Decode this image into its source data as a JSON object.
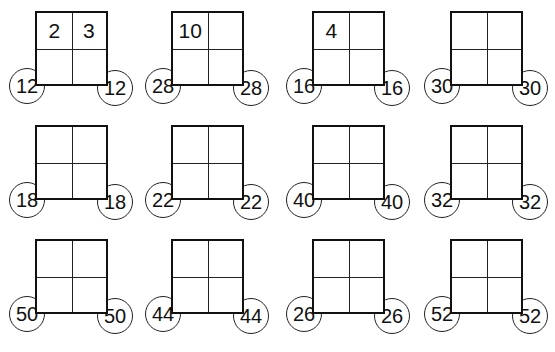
{
  "puzzles": [
    {
      "cells": [
        "2",
        "3",
        "",
        ""
      ],
      "left_product": "12",
      "right_product": "12"
    },
    {
      "cells": [
        "10",
        "",
        "",
        ""
      ],
      "left_product": "28",
      "right_product": "28"
    },
    {
      "cells": [
        "4",
        "",
        "",
        ""
      ],
      "left_product": "16",
      "right_product": "16"
    },
    {
      "cells": [
        "",
        "",
        "",
        ""
      ],
      "left_product": "30",
      "right_product": "30"
    },
    {
      "cells": [
        "",
        "",
        "",
        ""
      ],
      "left_product": "18",
      "right_product": "18"
    },
    {
      "cells": [
        "",
        "",
        "",
        ""
      ],
      "left_product": "22",
      "right_product": "22"
    },
    {
      "cells": [
        "",
        "",
        "",
        ""
      ],
      "left_product": "40",
      "right_product": "40"
    },
    {
      "cells": [
        "",
        "",
        "",
        ""
      ],
      "left_product": "32",
      "right_product": "32"
    },
    {
      "cells": [
        "",
        "",
        "",
        ""
      ],
      "left_product": "50",
      "right_product": "50"
    },
    {
      "cells": [
        "",
        "",
        "",
        ""
      ],
      "left_product": "44",
      "right_product": "44"
    },
    {
      "cells": [
        "",
        "",
        "",
        ""
      ],
      "left_product": "26",
      "right_product": "26"
    },
    {
      "cells": [
        "",
        "",
        "",
        ""
      ],
      "left_product": "52",
      "right_product": "52"
    }
  ]
}
